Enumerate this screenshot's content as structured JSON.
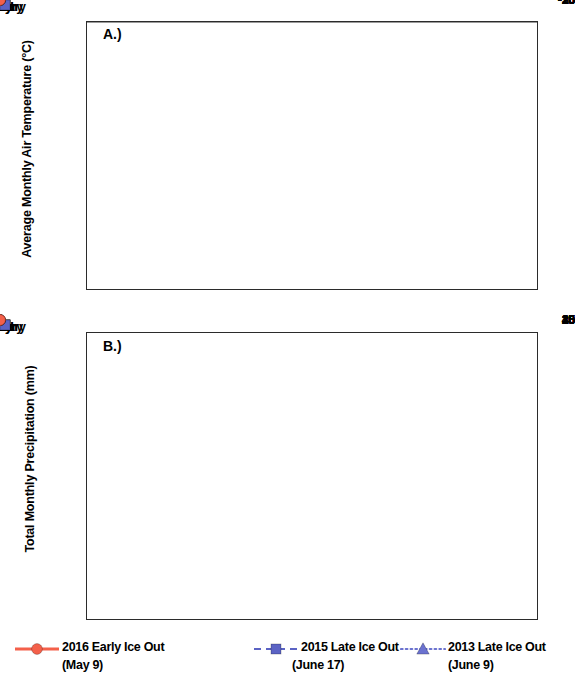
{
  "figure": {
    "panel_a_tag": "A.)",
    "panel_b_tag": "B.)"
  },
  "legend": {
    "entries": [
      {
        "label": "2016 Early Ice Out",
        "sub": "(May 9)",
        "marker": "circle",
        "line_style": "solid",
        "color": "#f4604a"
      },
      {
        "label": "2015 Late Ice Out",
        "sub": "(June 17)",
        "marker": "square",
        "line_style": "dashed",
        "color": "#5b63c4"
      },
      {
        "label": "2013 Late Ice Out",
        "sub": "(June 9)",
        "marker": "triangle",
        "line_style": "dotted",
        "color": "#6b72cf"
      }
    ]
  },
  "chart_data": [
    {
      "type": "line",
      "panel": "A.)",
      "title": "",
      "xlabel": "",
      "ylabel": "Average Monthly Air Temperature (°C)",
      "categories": [
        "January",
        "February",
        "March",
        "April",
        "May",
        "June",
        "July"
      ],
      "ylim": [
        -30,
        15
      ],
      "yticks": [
        15,
        10,
        5,
        0,
        -5,
        -10,
        -15,
        -20,
        -25,
        -30
      ],
      "grid": false,
      "zero_line": true,
      "legend_position": "bottom",
      "series": [
        {
          "name": "2016 Early Ice Out (May 9)",
          "color": "#f4604a",
          "marker": "circle",
          "line_style": "solid",
          "values": [
            -15.4,
            -16.3,
            -9.4,
            2.3,
            5.0,
            10.3,
            12.0
          ]
        },
        {
          "name": "2015 Late Ice Out (June 17)",
          "color": "#5b63c4",
          "marker": "square",
          "line_style": "dashed",
          "values": [
            -22.4,
            -25.9,
            -19.9,
            -11.4,
            0.8,
            9.6,
            10.7
          ]
        },
        {
          "name": "2013 Late Ice Out (June 9)",
          "color": "#6b72cf",
          "marker": "triangle",
          "line_style": "dotted",
          "values": [
            -17.0,
            -17.1,
            -10.1,
            -2.8,
            0.2,
            10.6,
            11.0
          ]
        }
      ]
    },
    {
      "type": "line",
      "panel": "B.)",
      "title": "",
      "xlabel": "",
      "ylabel": "Total Monthly Precipitation (mm)",
      "categories": [
        "January",
        "February",
        "March",
        "April",
        "May",
        "June",
        "July"
      ],
      "ylim": [
        0,
        45
      ],
      "yticks": [
        45,
        40,
        35,
        30,
        25,
        20,
        15,
        10,
        5,
        0
      ],
      "grid": false,
      "zero_line": false,
      "legend_position": "bottom",
      "series": [
        {
          "name": "2016 Early Ice Out (May 9)",
          "color": "#f4604a",
          "marker": "circle",
          "line_style": "solid",
          "values": [
            1.1,
            1.0,
            1.9,
            0.1,
            13.5,
            9.8,
            0.7
          ]
        },
        {
          "name": "2015 Late Ice Out (June 17)",
          "color": "#5b63c4",
          "marker": "square",
          "line_style": "dashed",
          "values": [
            3.2,
            3.0,
            4.0,
            1.6,
            3.0,
            6.7,
            5.6
          ]
        },
        {
          "name": "2013 Late Ice Out (June 9)",
          "color": "#6b72cf",
          "marker": "triangle",
          "line_style": "dotted",
          "values": [
            7.5,
            2.9,
            12.0,
            5.0,
            9.0,
            0.2,
            40.0
          ]
        }
      ]
    }
  ]
}
